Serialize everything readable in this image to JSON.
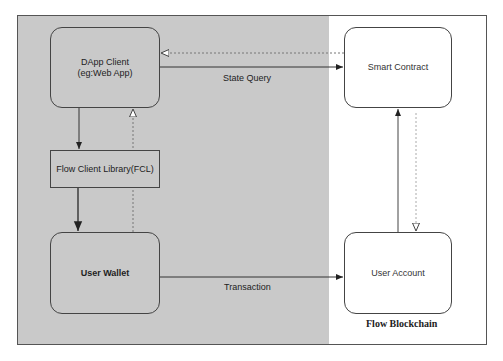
{
  "diagram": {
    "regions": {
      "client_side": {
        "fill": "#c9c9c9"
      },
      "blockchain": {
        "label": "Flow Blockchain",
        "fill": "#ffffff"
      }
    },
    "nodes": {
      "dapp_client": {
        "line1": "DApp Client",
        "line2": "(eg:Web App)"
      },
      "fcl": {
        "label": "Flow Client Library(FCL)"
      },
      "user_wallet": {
        "label": "User Wallet"
      },
      "smart_contract": {
        "label": "Smart Contract"
      },
      "user_account": {
        "label": "User Account"
      }
    },
    "edges": [
      {
        "from": "dapp_client",
        "to": "smart_contract",
        "label": "State Query",
        "style": "solid"
      },
      {
        "from": "smart_contract",
        "to": "dapp_client",
        "label": "",
        "style": "dashed"
      },
      {
        "from": "dapp_client",
        "to": "fcl",
        "label": "",
        "style": "solid"
      },
      {
        "from": "fcl",
        "to": "user_wallet",
        "label": "",
        "style": "solid"
      },
      {
        "from": "user_wallet",
        "to": "dapp_client",
        "label": "",
        "style": "dashed"
      },
      {
        "from": "user_wallet",
        "to": "user_account",
        "label": "Transaction",
        "style": "solid"
      },
      {
        "from": "user_account",
        "to": "smart_contract",
        "label": "",
        "style": "solid"
      },
      {
        "from": "smart_contract",
        "to": "user_account",
        "label": "",
        "style": "dashed"
      }
    ],
    "edge_labels": {
      "state_query": "State Query",
      "transaction": "Transaction"
    }
  }
}
